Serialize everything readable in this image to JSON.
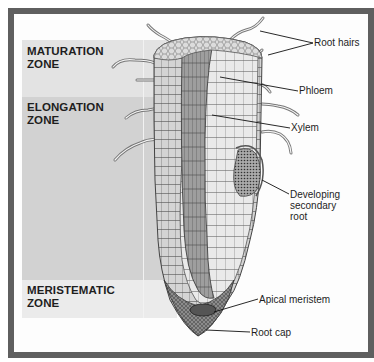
{
  "figure": {
    "zones": [
      {
        "id": "maturation",
        "label_line1": "MATURATION",
        "label_line2": "ZONE",
        "color": "#e3e3e3"
      },
      {
        "id": "elongation",
        "label_line1": "ELONGATION",
        "label_line2": "ZONE",
        "color": "#d2d2d2"
      },
      {
        "id": "meristematic",
        "label_line1": "MERISTEMATIC",
        "label_line2": "ZONE",
        "color": "#ebebeb"
      }
    ],
    "callouts": [
      {
        "id": "root-hairs",
        "label": "Root hairs"
      },
      {
        "id": "phloem",
        "label": "Phloem"
      },
      {
        "id": "xylem",
        "label": "Xylem"
      },
      {
        "id": "secondary-root",
        "label_line1": "Developing",
        "label_line2": "secondary",
        "label_line3": "root"
      },
      {
        "id": "apical-meristem",
        "label": "Apical meristem"
      },
      {
        "id": "root-cap",
        "label": "Root cap"
      }
    ],
    "colors": {
      "frame": "#5f5f5f",
      "background": "#fdfdfd",
      "text": "#1e1e1e",
      "cell_fill": "#c9c9c9",
      "cell_line": "#555555"
    }
  }
}
